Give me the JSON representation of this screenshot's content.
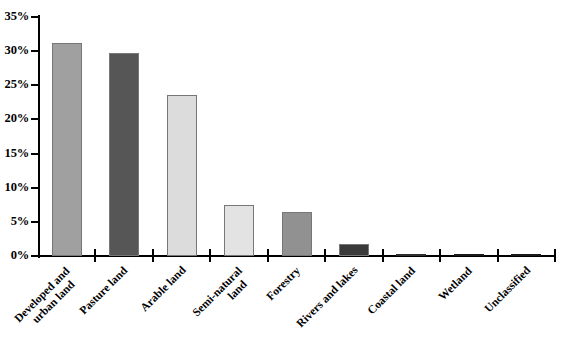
{
  "chart_data": {
    "type": "bar",
    "title": "",
    "subtitle": "",
    "xlabel": "",
    "ylabel": "",
    "categories": [
      "Developed and urban land",
      "Pasture land",
      "Arable land",
      "Semi-natural land",
      "Forestry",
      "Rivers and lakes",
      "Coastal land",
      "Wetland",
      "Unclassified"
    ],
    "category_lines": [
      [
        "Developed and",
        "urban land"
      ],
      [
        "Pasture land"
      ],
      [
        "Arable land"
      ],
      [
        "Semi-natural",
        "land"
      ],
      [
        "Forestry"
      ],
      [
        "Rivers and lakes"
      ],
      [
        "Coastal land"
      ],
      [
        "Wetland"
      ],
      [
        "Unclassified"
      ]
    ],
    "values": [
      31.2,
      29.8,
      23.6,
      7.5,
      6.4,
      1.8,
      0.3,
      0.05,
      0.05
    ],
    "value_labels": [
      "31.2%",
      "29.8%",
      "23.6%",
      "7.5%",
      "6.4%",
      "1.8%",
      "0.3%",
      "0%",
      "0%"
    ],
    "bar_colors": [
      "#a0a0a0",
      "#565656",
      "#dcdcdc",
      "#e3e3e3",
      "#919191",
      "#3a3a3a",
      "#2e2e2e",
      "#1a1a1a",
      "#1a1a1a"
    ],
    "bar_border_color": "#777777",
    "ylim": [
      0,
      35
    ],
    "ytick_values": [
      0,
      5,
      10,
      15,
      20,
      25,
      30,
      35
    ],
    "ytick_labels": [
      "0%",
      "5%",
      "10%",
      "15%",
      "20%",
      "25%",
      "30%",
      "35%"
    ],
    "grid": false,
    "legend": "none",
    "axis_color": "#000000",
    "background_color": "#ffffff"
  }
}
